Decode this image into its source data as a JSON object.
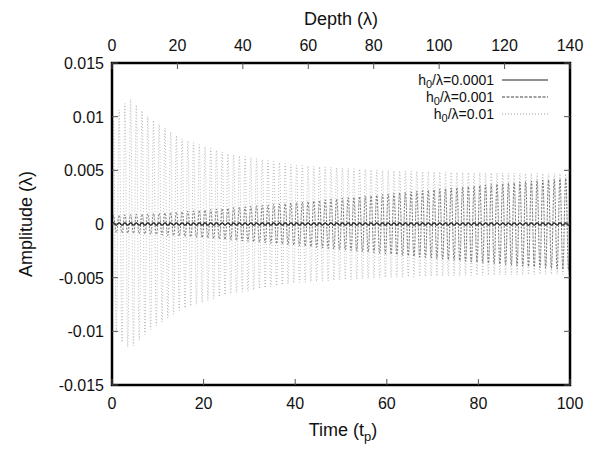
{
  "chart_data": {
    "type": "line",
    "title": "",
    "xlabel": "Time (t_p)",
    "x2label": "Depth (λ)",
    "ylabel": "Amplitude (λ)",
    "xlim": [
      0,
      100
    ],
    "x2lim": [
      0,
      140
    ],
    "ylim": [
      -0.015,
      0.015
    ],
    "xticks": [
      "0",
      "20",
      "40",
      "60",
      "80",
      "100"
    ],
    "x2ticks": [
      "0",
      "20",
      "40",
      "60",
      "80",
      "100",
      "120",
      "140"
    ],
    "yticks": [
      "0.015",
      "0.01",
      "0.005",
      "0",
      "-0.005",
      "-0.01",
      "-0.015"
    ],
    "grid": false,
    "legend_position": "upper right",
    "series": [
      {
        "name": "h0/λ=0.0001",
        "style": "solid",
        "envelope_t": [
          0,
          20,
          40,
          60,
          80,
          100
        ],
        "envelope_amp": [
          0.0001,
          0.0001,
          0.0001,
          0.0001,
          0.0001,
          0.0001
        ]
      },
      {
        "name": "h0/λ=0.001",
        "style": "dashed",
        "envelope_t": [
          0,
          10,
          20,
          40,
          60,
          80,
          100
        ],
        "envelope_amp": [
          0.0008,
          0.001,
          0.0013,
          0.002,
          0.0028,
          0.0036,
          0.0043
        ]
      },
      {
        "name": "h0/λ=0.01",
        "style": "dotted",
        "envelope_t": [
          0,
          2,
          4,
          8,
          15,
          25,
          40,
          60,
          80,
          100
        ],
        "envelope_amp": [
          0.0095,
          0.011,
          0.0117,
          0.01,
          0.008,
          0.0066,
          0.0055,
          0.005,
          0.0048,
          0.0047
        ]
      }
    ]
  },
  "labels": {
    "xlabel_main": "Time (t",
    "xlabel_sub": "p",
    "xlabel_end": ")",
    "x2label": "Depth (λ)",
    "ylabel": "Amplitude (λ)"
  },
  "legend": [
    {
      "prefix": "h",
      "sub": "0",
      "suffix": "/λ=0.0001"
    },
    {
      "prefix": "h",
      "sub": "0",
      "suffix": "/λ=0.001"
    },
    {
      "prefix": "h",
      "sub": "0",
      "suffix": "/λ=0.01"
    }
  ]
}
